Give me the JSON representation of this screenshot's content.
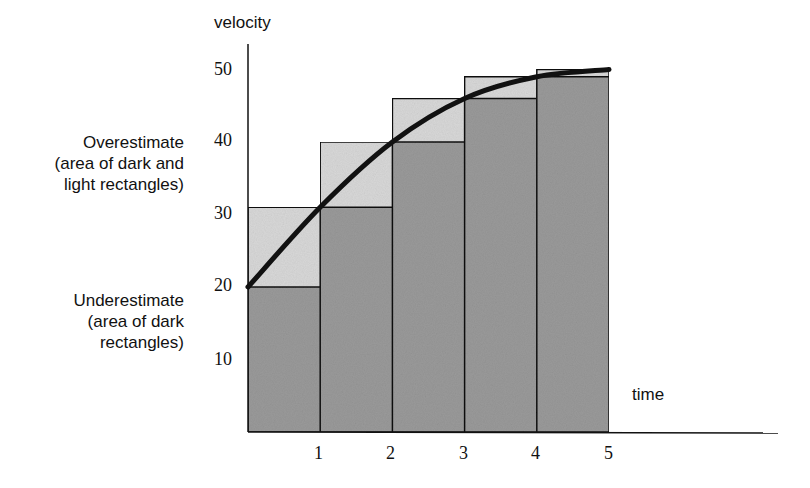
{
  "chart_data": {
    "type": "bar",
    "title": "",
    "xlabel": "time",
    "ylabel": "velocity",
    "x_ticks": [
      "1",
      "2",
      "3",
      "4",
      "5"
    ],
    "y_ticks": [
      "10",
      "20",
      "30",
      "40",
      "50"
    ],
    "ylim": [
      0,
      52
    ],
    "xlim": [
      0,
      7
    ],
    "categories": [
      "0-1",
      "1-2",
      "2-3",
      "3-4",
      "4-5"
    ],
    "series": [
      {
        "name": "Underestimate (dark rectangles)",
        "values": [
          20,
          31,
          40,
          46,
          49
        ]
      },
      {
        "name": "Overestimate (dark and light rectangles)",
        "values": [
          31,
          40,
          46,
          49,
          50
        ]
      }
    ],
    "curve": {
      "name": "velocity curve",
      "x": [
        0,
        1,
        2,
        3,
        4,
        5
      ],
      "y": [
        20,
        31,
        40,
        46,
        49,
        50
      ]
    },
    "annotations": [
      "Overestimate (area of dark and light rectangles)",
      "Underestimate (area of dark rectangles)"
    ],
    "grid": false
  },
  "labels": {
    "ylabel": "velocity",
    "xlabel": "time",
    "over": [
      "Overestimate",
      "(area of dark and",
      "light rectangles)"
    ],
    "under": [
      "Underestimate",
      "(area of dark",
      "rectangles)"
    ]
  },
  "colors": {
    "dark": "#9a9a9a",
    "light": "#d8d8d8",
    "line": "#111111"
  }
}
